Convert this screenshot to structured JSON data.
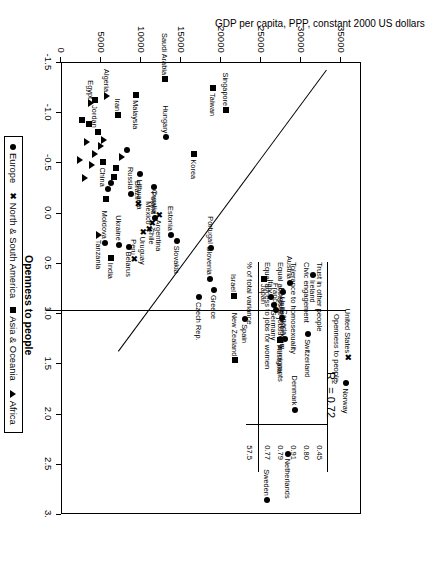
{
  "chart_data": {
    "type": "scatter",
    "title": "",
    "xlabel": "Openness to people",
    "ylabel": "GDP per capita, PPP, constant 2000 US dollars",
    "xlim": [
      -1.5,
      3.0
    ],
    "ylim": [
      0,
      37500
    ],
    "xticks": [
      "-1.5",
      "-1.0",
      "-0.5",
      "0.0",
      "0.5",
      "1.0",
      "1.5",
      "2.0",
      "2.5",
      "3."
    ],
    "yticks": [
      "0",
      "5000",
      "10000",
      "15000",
      "20000",
      "25000",
      "30000",
      "35000"
    ],
    "grid": false,
    "annotation": "R2 = 0.72",
    "annotation_r2_value": "0.72",
    "trendline": true,
    "legend_position": "below-right",
    "points": [
      {
        "label": "Sweden",
        "x": 2.86,
        "y": 25700,
        "group": "Europe"
      },
      {
        "label": "Netherlands",
        "x": 2.4,
        "y": 28400,
        "group": "Europe"
      },
      {
        "label": "Denmark",
        "x": 1.96,
        "y": 29300,
        "group": "Europe"
      },
      {
        "label": "Norway",
        "x": 1.7,
        "y": 35600,
        "group": "Europe"
      },
      {
        "label": "United States",
        "x": 1.44,
        "y": 35900,
        "group": "North & South America"
      },
      {
        "label": "Switzerland",
        "x": 1.21,
        "y": 30900,
        "group": "Europe"
      },
      {
        "label": "Canada",
        "x": 1.26,
        "y": 28000,
        "group": "Europe"
      },
      {
        "label": "Australia",
        "x": 1.27,
        "y": 27400,
        "group": "Asia & Oceania"
      },
      {
        "label": "Belgium",
        "x": 1.05,
        "y": 27600,
        "group": "Europe"
      },
      {
        "label": "Germany",
        "x": 0.92,
        "y": 26600,
        "group": "Europe"
      },
      {
        "label": "France",
        "x": 0.97,
        "y": 26900,
        "group": "Europe"
      },
      {
        "label": "Ireland",
        "x": 0.62,
        "y": 31500,
        "group": "Europe"
      },
      {
        "label": "Austria",
        "x": 0.7,
        "y": 28600,
        "group": "Europe"
      },
      {
        "label": "United Kingdom",
        "x": 0.79,
        "y": 27700,
        "group": "Europe"
      },
      {
        "label": "Italy",
        "x": 0.84,
        "y": 26300,
        "group": "Europe"
      },
      {
        "label": "Japan",
        "x": 0.66,
        "y": 25400,
        "group": "Asia & Oceania"
      },
      {
        "label": "Israel",
        "x": 0.83,
        "y": 21600,
        "group": "Asia & Oceania"
      },
      {
        "label": "Spain",
        "x": 1.06,
        "y": 23000,
        "group": "Europe"
      },
      {
        "label": "New Zealand",
        "x": 1.47,
        "y": 21700,
        "group": "Asia & Oceania"
      },
      {
        "label": "Greece",
        "x": 0.77,
        "y": 19100,
        "group": "Europe"
      },
      {
        "label": "Slovenia",
        "x": 0.66,
        "y": 18600,
        "group": "Europe"
      },
      {
        "label": "Czech Rep.",
        "x": 0.84,
        "y": 17200,
        "group": "Europe"
      },
      {
        "label": "Portugal",
        "x": 0.35,
        "y": 18800,
        "group": "Europe"
      },
      {
        "label": "Slovakia",
        "x": 0.28,
        "y": 14500,
        "group": "Europe"
      },
      {
        "label": "Estonia",
        "x": 0.22,
        "y": 13700,
        "group": "Europe"
      },
      {
        "label": "Argentina",
        "x": 0.02,
        "y": 12300,
        "group": "North & South America"
      },
      {
        "label": "Croatia",
        "x": 0.05,
        "y": 11800,
        "group": "Europe"
      },
      {
        "label": "Chile",
        "x": 0.1,
        "y": 11400,
        "group": "North & South America"
      },
      {
        "label": "Mexico",
        "x": 0.16,
        "y": 11000,
        "group": "North & South America"
      },
      {
        "label": "Uruguay",
        "x": 0.19,
        "y": 10200,
        "group": "North & South America"
      },
      {
        "label": "Peru",
        "x": 0.46,
        "y": 9100,
        "group": "North & South America"
      },
      {
        "label": "Belarus",
        "x": 0.34,
        "y": 8500,
        "group": "Europe"
      },
      {
        "label": "Ukraine",
        "x": 0.32,
        "y": 7200,
        "group": "Europe"
      },
      {
        "label": "India",
        "x": 0.45,
        "y": 6300,
        "group": "Asia & Oceania"
      },
      {
        "label": "Moldova",
        "x": 0.3,
        "y": 5500,
        "group": "Europe"
      },
      {
        "label": "Tanzania",
        "x": 0.22,
        "y": 4700,
        "group": "Africa"
      },
      {
        "label": "Brazil",
        "x": -0.09,
        "y": 9600,
        "group": "North & South America"
      },
      {
        "label": "Poland",
        "x": -0.26,
        "y": 11600,
        "group": "Europe"
      },
      {
        "label": "Russia",
        "x": -0.19,
        "y": 8700,
        "group": "Europe"
      },
      {
        "label": "Lithuania",
        "x": -0.38,
        "y": 9900,
        "group": "Europe"
      },
      {
        "label": "Hungary",
        "x": -0.75,
        "y": 13100,
        "group": "Europe"
      },
      {
        "label": "Korea",
        "x": -0.58,
        "y": 16600,
        "group": "Asia & Oceania"
      },
      {
        "label": "Singapore",
        "x": -1.02,
        "y": 20600,
        "group": "Asia & Oceania"
      },
      {
        "label": "Taiwan",
        "x": -1.24,
        "y": 19000,
        "group": "Asia & Oceania"
      },
      {
        "label": "Saudi Arabia",
        "x": -1.33,
        "y": 13000,
        "group": "Asia & Oceania"
      },
      {
        "label": "Malaysia",
        "x": -1.17,
        "y": 9400,
        "group": "Asia & Oceania"
      },
      {
        "label": "Iran",
        "x": -0.97,
        "y": 7100,
        "group": "Asia & Oceania"
      },
      {
        "label": "China",
        "x": -0.5,
        "y": 5200,
        "group": "Asia & Oceania"
      },
      {
        "label": "Algeria",
        "x": -1.16,
        "y": 5800,
        "group": "Africa"
      },
      {
        "label": "Jordan",
        "x": -1.12,
        "y": 4300,
        "group": "Asia & Oceania"
      },
      {
        "label": "Egypt",
        "x": -1.09,
        "y": 3700,
        "group": "Africa"
      }
    ],
    "unlabeled_points": [
      {
        "x": -0.62,
        "y": 8200,
        "group": "Europe"
      },
      {
        "x": -0.55,
        "y": 7600,
        "group": "Africa"
      },
      {
        "x": -0.44,
        "y": 6900,
        "group": "Asia & Oceania"
      },
      {
        "x": -0.36,
        "y": 6600,
        "group": "Asia & Oceania"
      },
      {
        "x": -0.3,
        "y": 6200,
        "group": "Europe"
      },
      {
        "x": -0.24,
        "y": 5900,
        "group": "Europe"
      },
      {
        "x": -0.14,
        "y": 5600,
        "group": "Asia & Oceania"
      },
      {
        "x": -0.72,
        "y": 5400,
        "group": "Africa"
      },
      {
        "x": -0.66,
        "y": 5000,
        "group": "Africa"
      },
      {
        "x": -0.8,
        "y": 4600,
        "group": "Asia & Oceania"
      },
      {
        "x": -0.58,
        "y": 4200,
        "group": "Africa"
      },
      {
        "x": -0.47,
        "y": 3900,
        "group": "Africa"
      },
      {
        "x": -0.88,
        "y": 3500,
        "group": "Asia & Oceania"
      },
      {
        "x": -0.7,
        "y": 3200,
        "group": "Africa"
      },
      {
        "x": -0.35,
        "y": 3000,
        "group": "Africa"
      },
      {
        "x": -0.92,
        "y": 2600,
        "group": "Asia & Oceania"
      },
      {
        "x": -0.52,
        "y": 2400,
        "group": "Africa"
      }
    ]
  },
  "inset_table": {
    "title": "Openness to people",
    "rows": [
      {
        "label": "Trust in other people",
        "value": "0.45"
      },
      {
        "label": "Civic engagement",
        "value": "0.80"
      },
      {
        "label": "Tolerance to homosexuality",
        "value": "0.91"
      },
      {
        "label": "Equal access to jobs for immigrants",
        "value": "0.79"
      },
      {
        "label": "Equal access to jobs for women",
        "value": "0.77"
      }
    ],
    "footer": {
      "label": "% of total variance",
      "value": "57.5"
    }
  },
  "legend": {
    "items": [
      {
        "label": "Europe",
        "marker": "circle-marker"
      },
      {
        "label": "North & South America",
        "marker": "x-marker"
      },
      {
        "label": "Asia & Oceania",
        "marker": "square-marker"
      },
      {
        "label": "Africa",
        "marker": "triangle-marker"
      }
    ]
  }
}
